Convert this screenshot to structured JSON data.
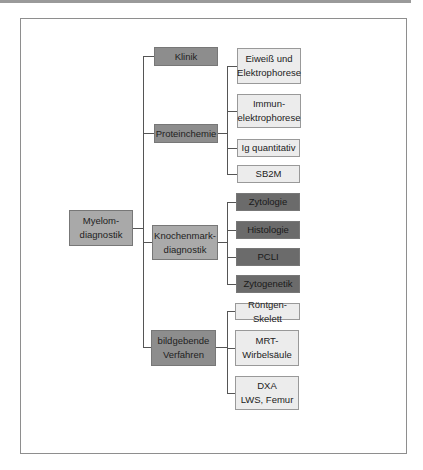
{
  "diagram": {
    "root": {
      "label": "Myelom-\ndiagnostik"
    },
    "branches": [
      {
        "label": "Klinik",
        "children": []
      },
      {
        "label": "Proteinchemie",
        "children": [
          {
            "label": "Eiweiß und\nElektrophorese"
          },
          {
            "label": "Immun-\nelektrophorese"
          },
          {
            "label": "Ig quantitativ"
          },
          {
            "label": "SB2M"
          }
        ]
      },
      {
        "label": "Knochenmark-\ndiagnostik",
        "children": [
          {
            "label": "Zytologie"
          },
          {
            "label": "Histologie"
          },
          {
            "label": "PCLI"
          },
          {
            "label": "Zytogenetik"
          }
        ]
      },
      {
        "label": "bildgebende\nVerfahren",
        "children": [
          {
            "label": "Röntgen-Skelett"
          },
          {
            "label": "MRT-\nWirbelsäule"
          },
          {
            "label": "DXA\nLWS, Femur"
          }
        ]
      }
    ]
  },
  "colors": {
    "root": "#a9a9a9",
    "branch": "#8d8d8d",
    "branch_alt": "#aaaaaa",
    "leaf_light": "#ececec",
    "leaf_dark": "#6b6b6b",
    "line": "#555555"
  }
}
